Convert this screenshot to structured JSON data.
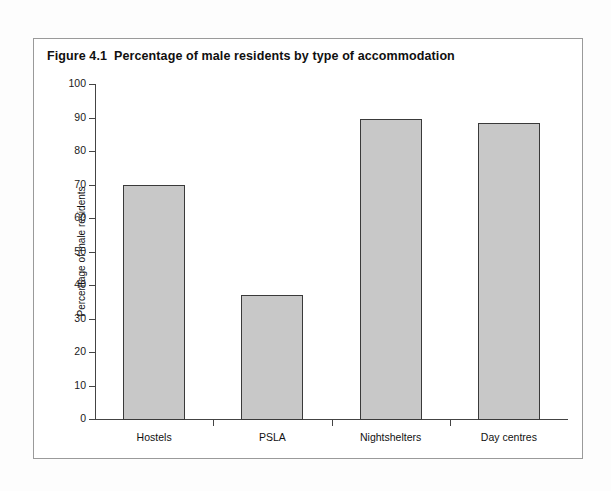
{
  "figure": {
    "label": "Figure 4.1",
    "title": "Percentage of male residents by type of accommodation"
  },
  "chart_data": {
    "type": "bar",
    "categories": [
      "Hostels",
      "PSLA",
      "Nightshelters",
      "Day centres"
    ],
    "values": [
      70,
      37,
      89.5,
      88.5
    ],
    "xlabel": "",
    "ylabel": "Percentage of male residents",
    "ylim": [
      0,
      100
    ],
    "ytick_step": 10,
    "yticks": [
      0,
      10,
      20,
      30,
      40,
      50,
      60,
      70,
      80,
      90,
      100
    ],
    "ytick_labels": [
      "0",
      "10",
      "20",
      "30",
      "40",
      "50",
      "60",
      "70",
      "80",
      "90",
      "100"
    ],
    "grid": false,
    "legend": null,
    "bar_color": "#c8c8c8",
    "bar_edge_color": "#3a3a3a",
    "axis_color": "#444444"
  }
}
